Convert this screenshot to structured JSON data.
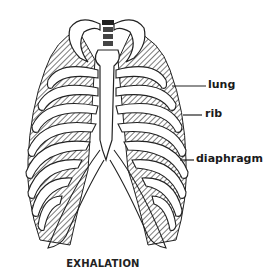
{
  "diagram": {
    "caption": "EXHALATION",
    "labels": [
      {
        "id": "lung",
        "text": "lung"
      },
      {
        "id": "rib",
        "text": "rib"
      },
      {
        "id": "diaphragm",
        "text": "diaphragm"
      }
    ]
  }
}
